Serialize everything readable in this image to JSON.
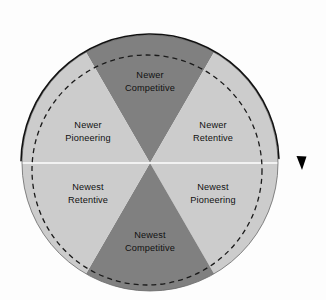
{
  "diagram": {
    "type": "segmented-circle",
    "background_color": "#fdfdfd",
    "center": {
      "x": 150,
      "y": 163
    },
    "radius": 128,
    "colors": {
      "dark_segment": "#808080",
      "light_segment": "#cccccc",
      "divider_line": "#ffffff",
      "outline": "#1a1a1a",
      "dashed_circle": "#1a1a1a",
      "label_text": "#111111",
      "arrow": "#000000"
    },
    "segments": [
      {
        "id": "newer-competitive",
        "line1": "Newer",
        "line2": "Competitive",
        "shade": "dark",
        "position": "top",
        "start_angle_deg": -120,
        "end_angle_deg": -60,
        "label_x": 150,
        "label_y": 78
      },
      {
        "id": "newer-retentive",
        "line1": "Newer",
        "line2": "Retentive",
        "shade": "light",
        "position": "upper-right",
        "start_angle_deg": -60,
        "end_angle_deg": 0,
        "label_x": 213,
        "label_y": 128
      },
      {
        "id": "newest-pioneering",
        "line1": "Newest",
        "line2": "Pioneering",
        "shade": "light",
        "position": "lower-right",
        "start_angle_deg": 0,
        "end_angle_deg": 60,
        "label_x": 213,
        "label_y": 190
      },
      {
        "id": "newest-competitive",
        "line1": "Newest",
        "line2": "Competitive",
        "shade": "dark",
        "position": "bottom",
        "start_angle_deg": 60,
        "end_angle_deg": 120,
        "label_x": 150,
        "label_y": 238
      },
      {
        "id": "newest-retentive",
        "line1": "Newest",
        "line2": "Retentive",
        "shade": "light",
        "position": "lower-left",
        "start_angle_deg": 120,
        "end_angle_deg": 180,
        "label_x": 88,
        "label_y": 190
      },
      {
        "id": "newer-pioneering",
        "line1": "Newer",
        "line2": "Pioneering",
        "shade": "light",
        "position": "upper-left",
        "start_angle_deg": 180,
        "end_angle_deg": 240,
        "label_x": 88,
        "label_y": 128
      }
    ],
    "dashed_circle": {
      "center_x": 147,
      "center_y": 170,
      "radius": 115,
      "dash_pattern": "5 4"
    },
    "direction_arrow": {
      "style": "solid-arc-clockwise",
      "arrowhead_x": 302,
      "arrowhead_y": 170
    }
  }
}
